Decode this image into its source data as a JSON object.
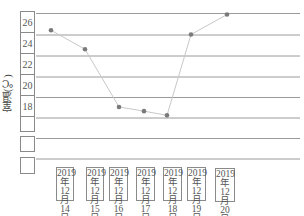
{
  "chart_data": {
    "type": "line",
    "title": "",
    "xlabel": "",
    "ylabel": "室温(℃)",
    "categories": [
      "2019年12月14日",
      "2019年12月15日",
      "2019年12月16日",
      "2019年12月17日",
      "2019年12月18日",
      "2019年12月19日",
      "2019年12月20日"
    ],
    "series": [
      {
        "name": "室温",
        "values": [
          24.4,
          22.6,
          17.1,
          16.7,
          16.3,
          24.0,
          25.9
        ]
      }
    ],
    "yticks": [
      "26",
      "24",
      "22",
      "20",
      "18",
      "",
      "",
      ""
    ],
    "ylim": [
      12,
      26
    ],
    "grid": true,
    "legend": null
  },
  "axis": {
    "ylabel": "室温(℃)",
    "yticks": [
      {
        "label": "26",
        "y": 11,
        "h": 22
      },
      {
        "label": "24",
        "y": 32,
        "h": 22
      },
      {
        "label": "22",
        "y": 53,
        "h": 22
      },
      {
        "label": "20",
        "y": 74,
        "h": 22
      },
      {
        "label": "18",
        "y": 95,
        "h": 22
      },
      {
        "label": "",
        "y": 116,
        "h": 16
      },
      {
        "label": "",
        "y": 136,
        "h": 16
      },
      {
        "label": "",
        "y": 157,
        "h": 17
      }
    ],
    "xlabels": [
      {
        "year": "2019",
        "nian": "年",
        "month": "12月",
        "day": "14日",
        "x": 56,
        "w": 18,
        "y": 167
      },
      {
        "year": "2019",
        "nian": "年",
        "month": "12月",
        "day": "15日",
        "x": 86,
        "w": 18,
        "y": 167
      },
      {
        "year": "2019",
        "nian": "年",
        "month": "12月",
        "day": "16日",
        "x": 109,
        "w": 19,
        "y": 167
      },
      {
        "year": "2019",
        "nian": "年",
        "month": "12月",
        "day": "17日",
        "x": 136,
        "w": 19,
        "y": 167
      },
      {
        "year": "2019",
        "nian": "年",
        "month": "12月",
        "day": "18日",
        "x": 163,
        "w": 19,
        "y": 167
      },
      {
        "year": "2019",
        "nian": "年",
        "month": "12月",
        "day": "19日",
        "x": 187,
        "w": 19,
        "y": 167
      },
      {
        "year": "2019",
        "nian": "年",
        "month": "12月",
        "day": "20日",
        "x": 215,
        "w": 20,
        "y": 168
      }
    ]
  },
  "style": {
    "line_color": "#c8c8c8",
    "marker_color": "#7a7a7a",
    "grid_color": "#9a9a9a",
    "box_color": "#8a8a8a"
  }
}
